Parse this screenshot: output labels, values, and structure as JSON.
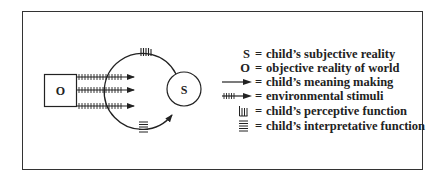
{
  "diagram": {
    "object_label": "O",
    "subject_label": "S",
    "colors": {
      "line": "#222222",
      "background": "#ffffff",
      "frame": "#333333"
    }
  },
  "legend": {
    "equals": "=",
    "items": [
      {
        "symbol": "S",
        "symbol_type": "text",
        "text": "child’s subjective reality"
      },
      {
        "symbol": "O",
        "symbol_type": "text",
        "text": "objective reality of world"
      },
      {
        "symbol": "arrow",
        "symbol_type": "arrow-icon",
        "text": "child’s meaning making"
      },
      {
        "symbol": "hatched-arrow",
        "symbol_type": "hatched-arrow-icon",
        "text": "environmental stimuli"
      },
      {
        "symbol": "vertical-bars",
        "symbol_type": "vertical-bars-icon",
        "text": "child’s perceptive function"
      },
      {
        "symbol": "horizontal-bars",
        "symbol_type": "horizontal-bars-icon",
        "text": "child’s interpretative function"
      }
    ]
  }
}
